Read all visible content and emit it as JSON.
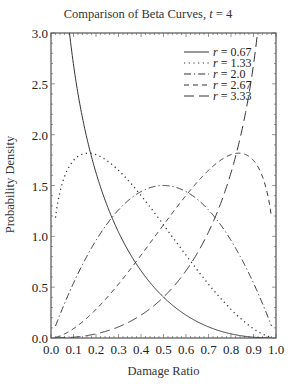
{
  "chart_data": {
    "type": "line",
    "title": "Comparison of Beta Curves, t = 4",
    "title_main": "Comparison of Beta Curves, ",
    "title_var": "t",
    "title_value": " = 4",
    "xlabel": "Damage Ratio",
    "ylabel": "Probability Density",
    "xlim": [
      0.0,
      1.0
    ],
    "ylim": [
      0.0,
      3.0
    ],
    "xticks": [
      "0.0",
      "0.1",
      "0.2",
      "0.3",
      "0.4",
      "0.5",
      "0.6",
      "0.7",
      "0.8",
      "0.9",
      "1.0"
    ],
    "yticks": [
      "0.0",
      "0.5",
      "1.0",
      "1.5",
      "2.0",
      "2.5",
      "3.0"
    ],
    "grid": false,
    "legend_position": "upper right",
    "t": 4,
    "series": [
      {
        "name": "r = 0.67",
        "r": 0.67,
        "alpha": 0.67,
        "beta": 3.33,
        "style": "solid",
        "x": [
          0.02,
          0.05,
          0.1,
          0.2,
          0.3,
          0.4,
          0.5,
          0.6,
          0.7,
          0.8,
          0.9,
          0.98
        ],
        "values": [
          3.9,
          2.7,
          1.95,
          1.25,
          0.83,
          0.53,
          0.32,
          0.17,
          0.08,
          0.03,
          0.005,
          0.0
        ]
      },
      {
        "name": "r = 1.33",
        "r": 1.33,
        "alpha": 1.33,
        "beta": 2.67,
        "style": "dotted",
        "x": [
          0.02,
          0.05,
          0.1,
          0.17,
          0.2,
          0.3,
          0.4,
          0.5,
          0.6,
          0.7,
          0.8,
          0.9,
          0.98
        ],
        "values": [
          1.19,
          1.5,
          1.75,
          1.81,
          1.8,
          1.68,
          1.47,
          1.2,
          0.9,
          0.59,
          0.3,
          0.08,
          0.0
        ]
      },
      {
        "name": "r = 2.0",
        "r": 2.0,
        "alpha": 2.0,
        "beta": 2.0,
        "style": "dash-dot",
        "x": [
          0.02,
          0.1,
          0.2,
          0.3,
          0.4,
          0.5,
          0.6,
          0.7,
          0.8,
          0.9,
          0.98
        ],
        "values": [
          0.12,
          0.54,
          0.96,
          1.26,
          1.44,
          1.5,
          1.44,
          1.26,
          0.96,
          0.54,
          0.12
        ]
      },
      {
        "name": "r = 2.67",
        "r": 2.67,
        "alpha": 2.67,
        "beta": 1.33,
        "style": "dashed",
        "x": [
          0.02,
          0.1,
          0.2,
          0.3,
          0.4,
          0.5,
          0.6,
          0.7,
          0.8,
          0.83,
          0.9,
          0.95,
          0.98
        ],
        "values": [
          0.0,
          0.08,
          0.3,
          0.59,
          0.9,
          1.2,
          1.47,
          1.68,
          1.8,
          1.81,
          1.75,
          1.5,
          1.19
        ]
      },
      {
        "name": "r = 3.33",
        "r": 3.33,
        "alpha": 3.33,
        "beta": 0.67,
        "style": "long-dash",
        "x": [
          0.02,
          0.1,
          0.2,
          0.3,
          0.4,
          0.5,
          0.6,
          0.7,
          0.8,
          0.9,
          0.95
        ],
        "values": [
          0.0,
          0.005,
          0.03,
          0.08,
          0.17,
          0.32,
          0.53,
          0.83,
          1.25,
          1.95,
          2.7
        ]
      }
    ]
  }
}
